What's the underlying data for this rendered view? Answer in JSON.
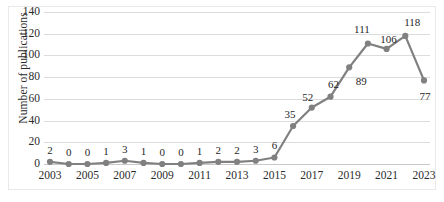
{
  "chart_data": {
    "type": "line",
    "title": "",
    "xlabel": "",
    "ylabel": "Number of publications",
    "ylim": [
      0,
      140
    ],
    "ytick_values": [
      0,
      20,
      40,
      60,
      80,
      100,
      120,
      140
    ],
    "ytick_labels": [
      "0",
      "20",
      "40",
      "60",
      "80",
      "100",
      "120",
      "140"
    ],
    "xtick_labels": [
      "2003",
      "2005",
      "2007",
      "2009",
      "2011",
      "2013",
      "2015",
      "2017",
      "2019",
      "2021",
      "2023"
    ],
    "xtick_years": [
      2003,
      2005,
      2007,
      2009,
      2011,
      2013,
      2015,
      2017,
      2019,
      2021,
      2023
    ],
    "grid": true,
    "legend": null,
    "x": [
      2003,
      2004,
      2005,
      2006,
      2007,
      2008,
      2009,
      2010,
      2011,
      2012,
      2013,
      2014,
      2015,
      2016,
      2017,
      2018,
      2019,
      2020,
      2021,
      2022,
      2023
    ],
    "values": [
      2,
      0,
      0,
      1,
      3,
      1,
      0,
      0,
      1,
      2,
      2,
      3,
      6,
      35,
      52,
      62,
      89,
      111,
      106,
      118,
      77
    ],
    "point_labels": [
      "2",
      "0",
      "0",
      "1",
      "3",
      "1",
      "0",
      "0",
      "1",
      "2",
      "2",
      "3",
      "6",
      "35",
      "52",
      "62",
      "89",
      "111",
      "106",
      "118",
      "77"
    ],
    "series_color": "#808080",
    "marker_color": "#808080",
    "grid_color": "#dcdcdc",
    "text_color": "#2b2b2b",
    "background_color": "#ffffff"
  }
}
